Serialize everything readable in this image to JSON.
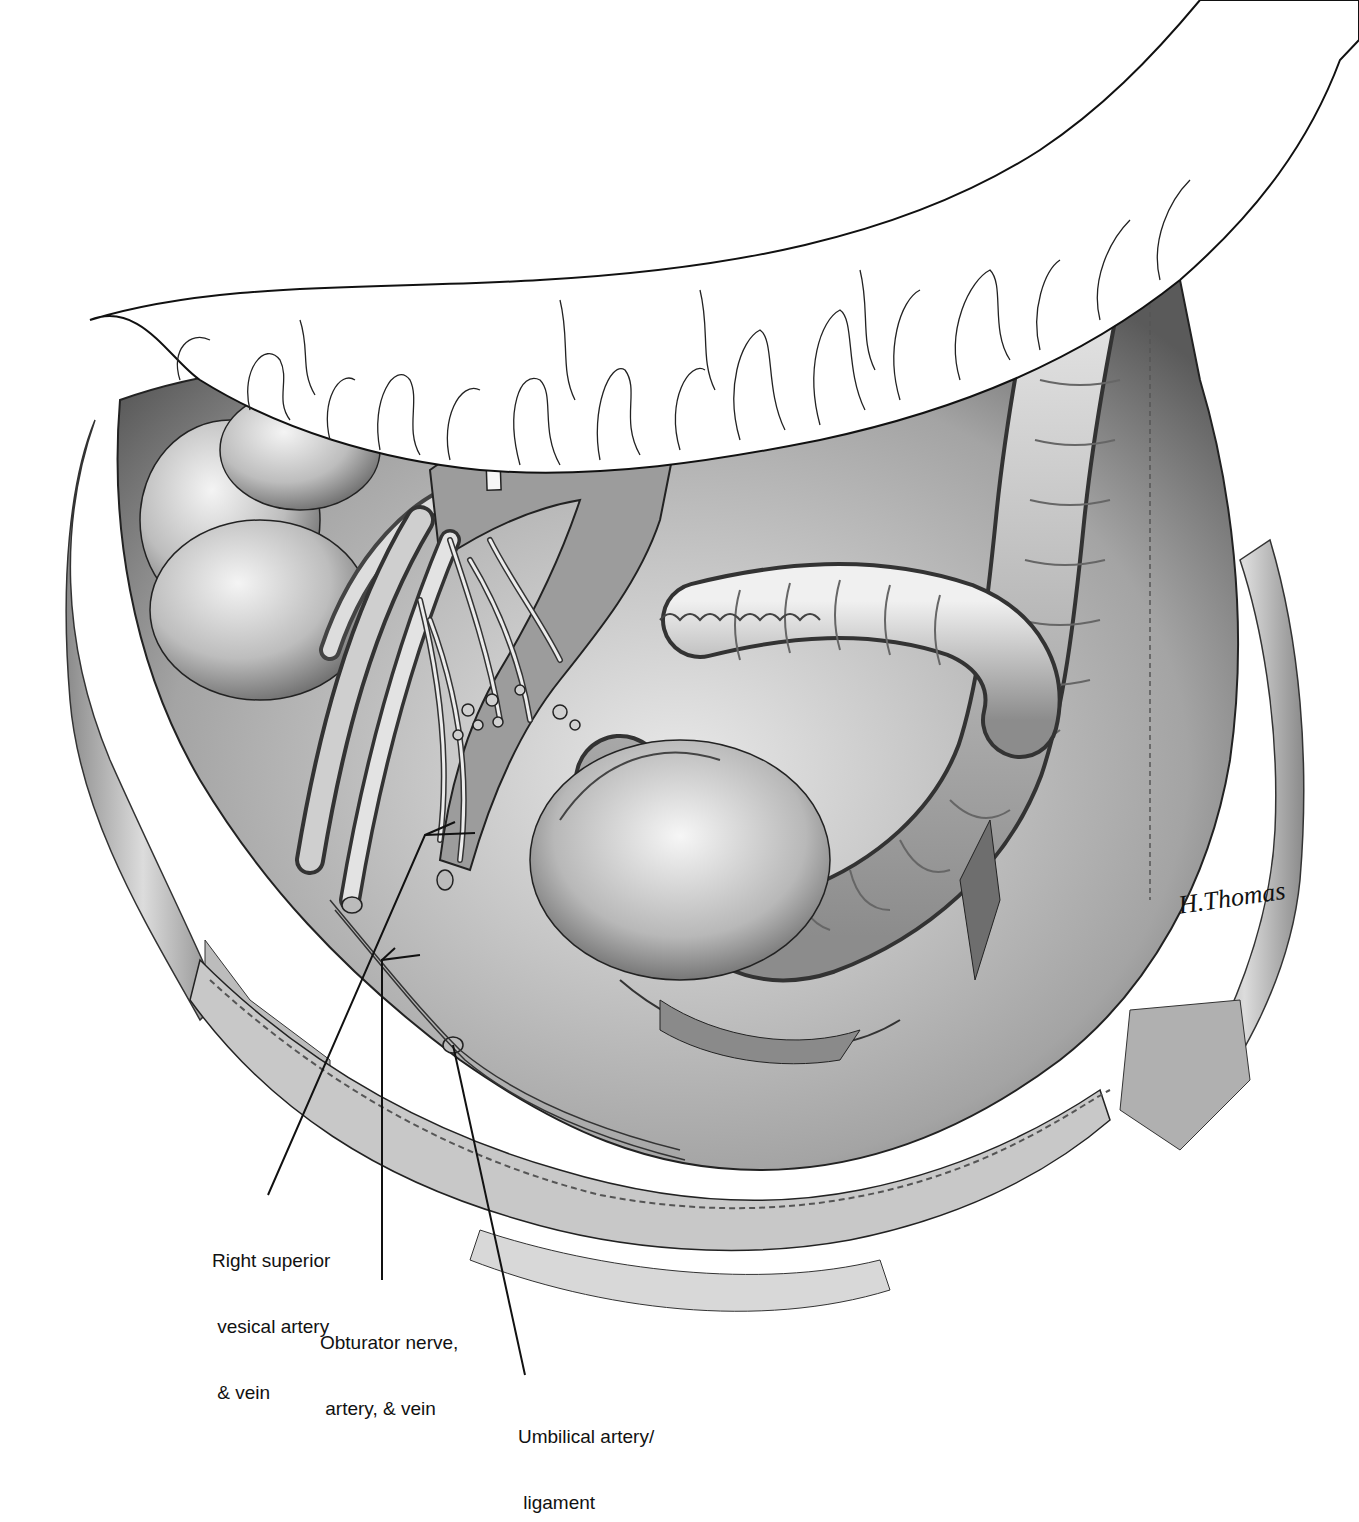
{
  "figure": {
    "type": "surgical anatomical illustration",
    "signature": "H.Thomas",
    "palette": {
      "ink": "#111111",
      "shade_dark": "#6e6e6e",
      "shade_mid": "#a8a8a8",
      "shade_light": "#d6d6d6",
      "highlight": "#f2f2f2",
      "background": "#ffffff"
    }
  },
  "labels": [
    {
      "id": "right-superior-vesical",
      "lines": [
        "Right superior",
        " vesical artery",
        " & vein"
      ]
    },
    {
      "id": "obturator",
      "lines": [
        "Obturator nerve,",
        " artery, & vein"
      ]
    },
    {
      "id": "umbilical",
      "lines": [
        "Umbilical artery/",
        " ligament"
      ]
    }
  ]
}
